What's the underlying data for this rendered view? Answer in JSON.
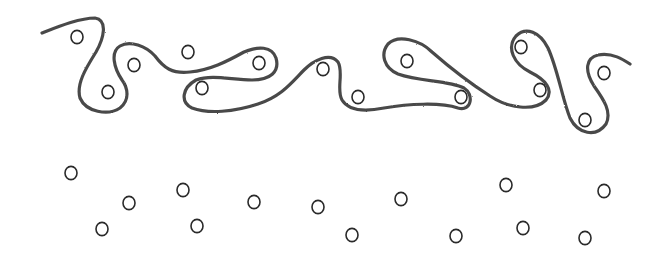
{
  "diagram": {
    "colors": {
      "background": "#ffffff",
      "curve_stroke": "#4a4a4a",
      "circle_stroke": "#2a2a2a"
    },
    "curve": {
      "path": "M42,33 C60,26 80,18 95,18 C108,20 104,38 96,52 C86,68 76,84 80,98 C86,112 108,116 120,108 C130,100 128,88 122,80 C114,68 110,52 120,46 C130,40 146,46 155,56 C164,68 172,74 190,72 C210,70 226,62 244,52 C258,46 272,46 276,58 C280,72 270,80 252,80 C232,80 212,74 196,80 C182,88 180,102 192,108 C208,114 234,112 258,104 C282,96 292,82 304,70 C314,60 330,52 338,62 C344,72 336,90 342,100 C348,110 364,112 384,108 C408,104 440,102 458,108 C472,112 474,94 464,88 C448,80 420,82 398,74 C384,68 380,54 388,44 C398,34 420,40 432,52 C448,66 468,82 490,96 C508,108 534,112 546,100 C554,90 546,80 530,72 C514,64 506,48 516,36 C526,26 540,32 548,48 C558,70 562,98 570,118 C578,134 596,138 606,124 C612,112 604,100 594,86 C584,70 586,58 598,55 C612,52 624,60 630,64"
    },
    "circles_above": [
      {
        "cx": 77,
        "cy": 37
      },
      {
        "cx": 108,
        "cy": 92
      },
      {
        "cx": 134,
        "cy": 65
      },
      {
        "cx": 188,
        "cy": 52
      },
      {
        "cx": 202,
        "cy": 88
      },
      {
        "cx": 259,
        "cy": 63
      },
      {
        "cx": 323,
        "cy": 69
      },
      {
        "cx": 358,
        "cy": 97
      },
      {
        "cx": 407,
        "cy": 61
      },
      {
        "cx": 461,
        "cy": 97
      },
      {
        "cx": 521,
        "cy": 47
      },
      {
        "cx": 540,
        "cy": 90
      },
      {
        "cx": 585,
        "cy": 120
      },
      {
        "cx": 604,
        "cy": 73
      }
    ],
    "circles_below": [
      {
        "cx": 71,
        "cy": 173
      },
      {
        "cx": 102,
        "cy": 229
      },
      {
        "cx": 129,
        "cy": 203
      },
      {
        "cx": 183,
        "cy": 190
      },
      {
        "cx": 197,
        "cy": 226
      },
      {
        "cx": 254,
        "cy": 202
      },
      {
        "cx": 318,
        "cy": 207
      },
      {
        "cx": 352,
        "cy": 235
      },
      {
        "cx": 401,
        "cy": 199
      },
      {
        "cx": 456,
        "cy": 236
      },
      {
        "cx": 506,
        "cy": 185
      },
      {
        "cx": 523,
        "cy": 228
      },
      {
        "cx": 604,
        "cy": 191
      },
      {
        "cx": 585,
        "cy": 238
      }
    ],
    "circle_radius": 6
  }
}
